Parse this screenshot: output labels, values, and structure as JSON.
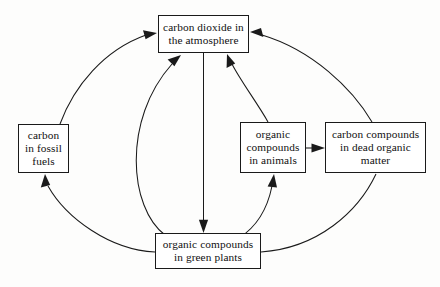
{
  "diagram": {
    "type": "cycle-flow-diagram",
    "background_color": "#fdfdfc",
    "stroke_color": "#1a1a1a",
    "nodes": [
      {
        "id": "atmosphere",
        "label": "carbon dioxide in\nthe atmosphere",
        "name": "carbon-dioxide-in-the-atmosphere"
      },
      {
        "id": "fossil",
        "label": "carbon\nin fossil\nfuels",
        "name": "carbon-in-fossil-fuels"
      },
      {
        "id": "animals",
        "label": "organic\ncompounds\nin animals",
        "name": "organic-compounds-in-animals"
      },
      {
        "id": "dead",
        "label": "carbon compounds\nin dead organic\nmatter",
        "name": "carbon-compounds-in-dead-organic-matter"
      },
      {
        "id": "plants",
        "label": "organic compounds\nin green plants",
        "name": "organic-compounds-in-green-plants"
      }
    ],
    "edges": [
      {
        "id": "fossil-to-atmosphere",
        "from": "fossil",
        "to": "atmosphere",
        "style": "curved"
      },
      {
        "id": "plants-to-atmosphere",
        "from": "plants",
        "to": "atmosphere",
        "style": "curved"
      },
      {
        "id": "atmosphere-to-plants",
        "from": "atmosphere",
        "to": "plants",
        "style": "straight"
      },
      {
        "id": "animals-to-atmosphere",
        "from": "animals",
        "to": "atmosphere",
        "style": "curved"
      },
      {
        "id": "dead-to-atmosphere",
        "from": "dead",
        "to": "atmosphere",
        "style": "curved"
      },
      {
        "id": "plants-to-animals",
        "from": "plants",
        "to": "animals",
        "style": "curved"
      },
      {
        "id": "plants-to-dead",
        "from": "plants",
        "to": "dead",
        "style": "curved"
      },
      {
        "id": "animals-to-dead",
        "from": "animals",
        "to": "dead",
        "style": "straight"
      },
      {
        "id": "plants-to-fossil",
        "from": "plants",
        "to": "fossil",
        "style": "curved"
      }
    ]
  }
}
